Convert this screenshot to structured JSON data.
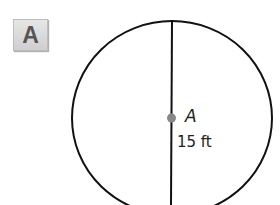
{
  "badge": {
    "label": "A"
  },
  "figure": {
    "center_label": "A",
    "measure_label": "15 ft",
    "stroke_color": "#111111",
    "center_dot_color": "#888888"
  }
}
